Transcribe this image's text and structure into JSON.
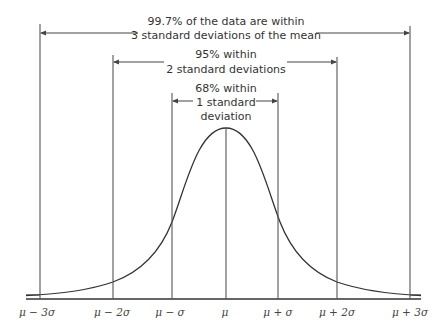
{
  "diagram": {
    "type": "normal-distribution-empirical-rule",
    "brackets": [
      {
        "id": "3sd",
        "line1": "99.7% of the data are within",
        "line2": "3 standard deviations of the mean"
      },
      {
        "id": "2sd",
        "line1": "95% within",
        "line2": "2 standard deviations"
      },
      {
        "id": "1sd",
        "line1": "68% within",
        "line2": "1 standard",
        "line3": "deviation"
      }
    ],
    "axis_labels": [
      "μ − 3σ",
      "μ − 2σ",
      "μ − σ",
      "μ",
      "μ + σ",
      "μ + 2σ",
      "μ + 3σ"
    ],
    "colors": {
      "line": "#333333",
      "text": "#333333",
      "background": "#ffffff"
    }
  }
}
